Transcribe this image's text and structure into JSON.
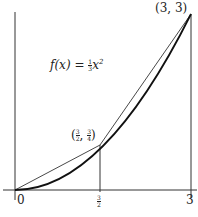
{
  "figure": {
    "function_label": "f(x) = ⅓x²",
    "function_expr": {
      "name": "f(x)",
      "equals": "=",
      "coef_num": "1",
      "coef_den": "3",
      "var": "x",
      "exp": "2"
    },
    "points": [
      {
        "label": "(3, 3)",
        "x": 3,
        "y": 3
      },
      {
        "label": "(3/2, 3/4)",
        "x_num": "3",
        "x_den": "2",
        "y_num": "3",
        "y_den": "4"
      }
    ],
    "x_ticks": [
      {
        "label": "0"
      },
      {
        "label_num": "3",
        "label_den": "2"
      },
      {
        "label": "3"
      }
    ],
    "colors": {
      "curve": "#222222",
      "line": "#333333",
      "background": "#ffffff"
    }
  }
}
